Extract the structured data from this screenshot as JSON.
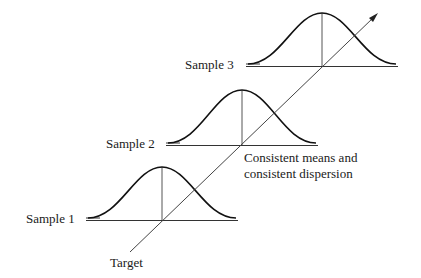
{
  "diagram": {
    "samples": [
      {
        "label": "Sample 1",
        "peak": [
          162,
          167
        ],
        "baseline_y": 220,
        "x_start": 88,
        "x_end": 238,
        "label_pos": [
          26,
          211
        ]
      },
      {
        "label": "Sample 2",
        "peak": [
          242,
          90
        ],
        "baseline_y": 145,
        "x_start": 167,
        "x_end": 318,
        "label_pos": [
          106,
          136
        ]
      },
      {
        "label": "Sample 3",
        "peak": [
          322,
          13
        ],
        "baseline_y": 66,
        "x_start": 247,
        "x_end": 398,
        "label_pos": [
          185,
          57
        ]
      }
    ],
    "target_label": "Target",
    "annotation_line1": "Consistent means and",
    "annotation_line2": "consistent dispersion",
    "line_color": "#222222"
  }
}
